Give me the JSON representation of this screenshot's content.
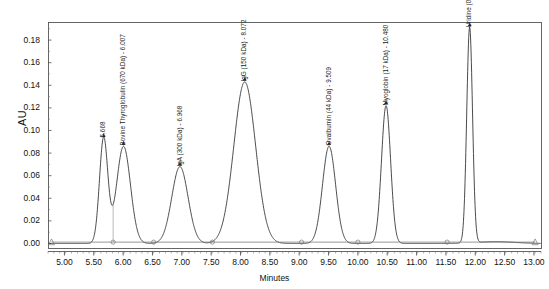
{
  "chart_data": {
    "type": "line",
    "title": "",
    "xlabel": "Minutes",
    "ylabel": "AU",
    "xlim": [
      4.72,
      13.12
    ],
    "ylim": [
      -0.004,
      0.196
    ],
    "grid": false,
    "legend_position": "none",
    "x_ticks": [
      "5.00",
      "5.50",
      "6.00",
      "6.50",
      "7.00",
      "7.50",
      "8.00",
      "8.50",
      "9.00",
      "9.50",
      "10.00",
      "10.50",
      "11.00",
      "11.50",
      "12.00",
      "12.50",
      "13.00"
    ],
    "x_tick_values": [
      5.0,
      5.5,
      6.0,
      6.5,
      7.0,
      7.5,
      8.0,
      8.5,
      9.0,
      9.5,
      10.0,
      10.5,
      11.0,
      11.5,
      12.0,
      12.5,
      13.0
    ],
    "y_ticks": [
      "0.18",
      "0.16",
      "0.14",
      "0.12",
      "0.10",
      "0.08",
      "0.06",
      "0.04",
      "0.02",
      "0.00"
    ],
    "y_tick_values": [
      0.18,
      0.16,
      0.14,
      0.12,
      0.1,
      0.08,
      0.06,
      0.04,
      0.02,
      0.0
    ],
    "series": [
      {
        "name": "UV absorbance trace",
        "peaks": [
          {
            "label": "5.668",
            "retention_time": 5.668,
            "height": 0.093,
            "width": 0.105,
            "kDa": null
          },
          {
            "label": "Bovine Thyroglobulin (670 kDa) - 6.007",
            "retention_time": 6.007,
            "height": 0.086,
            "width": 0.175,
            "kDa": 670
          },
          {
            "label": "IgA (300 kDa) - 6.968",
            "retention_time": 6.968,
            "height": 0.068,
            "width": 0.205,
            "kDa": 300
          },
          {
            "label": "IgG (150 kDa) - 8.072",
            "retention_time": 8.072,
            "height": 0.143,
            "width": 0.275,
            "kDa": 150
          },
          {
            "label": "Ovalbumin (44 kDa) - 9.509",
            "retention_time": 9.509,
            "height": 0.086,
            "width": 0.165,
            "kDa": 44
          },
          {
            "label": "Myoglobin (17 kDa) - 10.480",
            "retention_time": 10.48,
            "height": 0.122,
            "width": 0.115,
            "kDa": 17
          },
          {
            "label": "Uridine (0.244 kDa) - 11.904",
            "retention_time": 11.904,
            "height": 0.191,
            "width": 0.073,
            "kDa": 0.244
          }
        ],
        "baseline_markers": [
          {
            "retention_time": 4.78,
            "shape": "triangle"
          },
          {
            "retention_time": 5.83,
            "shape": "circle"
          },
          {
            "retention_time": 6.52,
            "shape": "circle"
          },
          {
            "retention_time": 7.52,
            "shape": "circle"
          },
          {
            "retention_time": 9.04,
            "shape": "circle"
          },
          {
            "retention_time": 10.0,
            "shape": "circle"
          },
          {
            "retention_time": 11.52,
            "shape": "circle"
          },
          {
            "retention_time": 13.02,
            "shape": "triangle"
          }
        ]
      }
    ]
  },
  "axes": {
    "y_title": "AU",
    "x_title": "Minutes"
  }
}
